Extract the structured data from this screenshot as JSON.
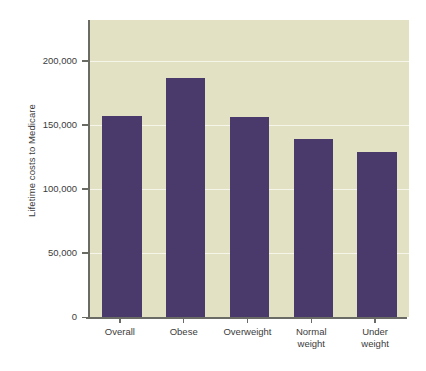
{
  "chart_data": {
    "type": "bar",
    "title": "",
    "subtitle": "",
    "xlabel": "",
    "ylabel": "Lifetime costs to Medicare",
    "categories": [
      "Overall",
      "Obese",
      "Overweight",
      "Normal\nweight",
      "Under\nweight"
    ],
    "values": [
      157000,
      187000,
      156000,
      139000,
      129000
    ],
    "ylim": [
      0,
      232000
    ],
    "yticks": [
      0,
      50000,
      100000,
      150000,
      200000
    ],
    "ytick_labels": [
      "0",
      "50,000",
      "100,000",
      "150,000",
      "200,000"
    ],
    "grid": "horizontal",
    "legend": "none",
    "bar_color": "#493a6b",
    "plot_background": "#e2e1c3",
    "gridline_color": "#f6f5ea",
    "axis_color": "#6b6b66",
    "text_color": "#3c3c3c"
  }
}
